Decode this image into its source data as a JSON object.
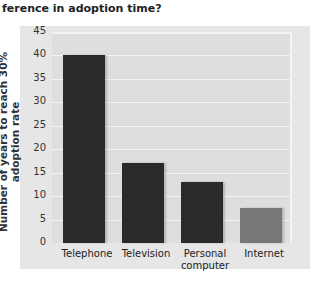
{
  "question": "ference in adoption time?",
  "chart_data": {
    "type": "bar",
    "title": "",
    "xlabel": "",
    "ylabel": "Number of years to reach 30% adoption rate",
    "categories": [
      "Telephone",
      "Television",
      "Personal computer",
      "Internet"
    ],
    "values": [
      40,
      17,
      13,
      7.5
    ],
    "ylim": [
      0,
      45
    ],
    "yticks": [
      "0",
      "5",
      "10",
      "15",
      "20",
      "25",
      "30",
      "35",
      "40",
      "45"
    ],
    "grid": true,
    "colors": [
      "#2a2a2a",
      "#2a2a2a",
      "#2a2a2a",
      "#777777"
    ]
  },
  "labels": {
    "x0": "Telephone",
    "x1": "Television",
    "x2a": "Personal",
    "x2b": "computer",
    "x3": "Internet"
  }
}
